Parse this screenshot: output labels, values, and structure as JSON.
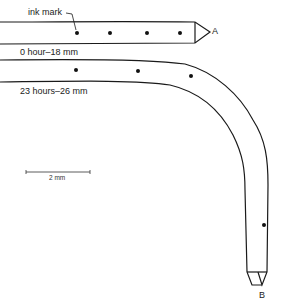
{
  "figure": {
    "labels": {
      "ink_mark": "ink mark",
      "top_root_caption": "0 hour–18 mm",
      "bottom_root_caption": "23 hours–26 mm",
      "tip_a": "A",
      "tip_b": "B",
      "scale_bar": "2 mm"
    },
    "top_root": {
      "time": "0 hour",
      "length": "18 mm",
      "ink_marks": 4,
      "tip": "A"
    },
    "bottom_root": {
      "time": "23 hours",
      "length": "26 mm",
      "ink_marks": 4,
      "tip": "B"
    },
    "colors": {
      "line": "#1a1a1a",
      "background": "#ffffff"
    }
  }
}
